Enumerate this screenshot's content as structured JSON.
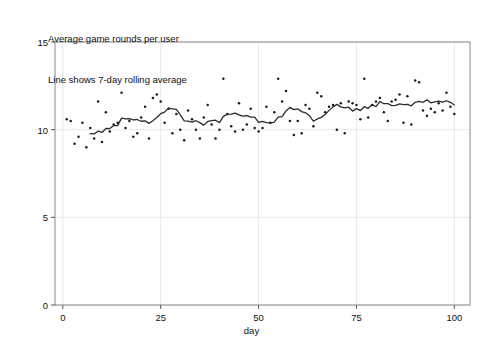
{
  "caption": {
    "line1": "Average game rounds per user",
    "line2": "Line shows 7-day rolling average"
  },
  "chart_data": {
    "type": "scatter",
    "title": "Average game rounds per user",
    "subtitle": "Line shows 7-day rolling average",
    "xlabel": "day",
    "ylabel": "",
    "xlim": [
      -2,
      104
    ],
    "ylim": [
      0,
      15
    ],
    "xticks": [
      0,
      25,
      50,
      75,
      100
    ],
    "yticks": [
      0,
      5,
      10,
      15
    ],
    "grid": true,
    "grid_color": "#e8e8e8",
    "marker_color": "#1a1a1a",
    "line_color": "#2b2b2b",
    "legend": null,
    "series": [
      {
        "name": "daily average rounds",
        "type": "scatter",
        "x": [
          1,
          2,
          3,
          4,
          5,
          6,
          7,
          8,
          9,
          10,
          11,
          12,
          13,
          14,
          15,
          16,
          17,
          18,
          19,
          20,
          21,
          22,
          23,
          24,
          25,
          26,
          27,
          28,
          29,
          30,
          31,
          32,
          33,
          34,
          35,
          36,
          37,
          38,
          39,
          40,
          41,
          42,
          43,
          44,
          45,
          46,
          47,
          48,
          49,
          50,
          51,
          52,
          53,
          54,
          55,
          56,
          57,
          58,
          59,
          60,
          61,
          62,
          63,
          64,
          65,
          66,
          67,
          68,
          69,
          70,
          71,
          72,
          73,
          74,
          75,
          76,
          77,
          78,
          79,
          80,
          81,
          82,
          83,
          84,
          85,
          86,
          87,
          88,
          89,
          90,
          91,
          92,
          93,
          94,
          95,
          96,
          97,
          98,
          99,
          100
        ],
        "y": [
          10.6,
          10.5,
          9.2,
          9.6,
          10.4,
          9.0,
          10.1,
          9.5,
          11.6,
          9.3,
          11.0,
          9.9,
          10.3,
          10.4,
          12.1,
          10.1,
          10.5,
          9.6,
          9.8,
          10.7,
          11.3,
          9.5,
          11.8,
          12.0,
          11.6,
          10.4,
          11.2,
          9.8,
          10.9,
          10.0,
          9.4,
          11.1,
          10.6,
          10.0,
          9.5,
          10.7,
          11.4,
          10.3,
          9.5,
          10.0,
          12.9,
          10.9,
          10.2,
          9.9,
          11.5,
          10.0,
          10.3,
          11.2,
          10.1,
          9.9,
          10.1,
          11.3,
          10.4,
          11.0,
          12.9,
          11.6,
          12.2,
          10.5,
          9.7,
          10.5,
          9.8,
          11.4,
          11.2,
          10.2,
          12.1,
          11.9,
          11.0,
          11.3,
          11.4,
          10.0,
          11.5,
          9.8,
          11.6,
          11.5,
          11.4,
          10.6,
          12.9,
          10.7,
          11.4,
          11.6,
          11.8,
          11.0,
          10.5,
          11.6,
          11.7,
          12.0,
          10.4,
          11.9,
          10.3,
          12.8,
          12.7,
          11.1,
          10.8,
          11.2,
          11.0,
          11.5,
          11.1,
          12.1,
          11.3,
          10.9
        ]
      },
      {
        "name": "7-day rolling average",
        "type": "line",
        "x": [
          7,
          8,
          9,
          10,
          11,
          12,
          13,
          14,
          15,
          16,
          17,
          18,
          19,
          20,
          21,
          22,
          23,
          24,
          25,
          26,
          27,
          28,
          29,
          30,
          31,
          32,
          33,
          34,
          35,
          36,
          37,
          38,
          39,
          40,
          41,
          42,
          43,
          44,
          45,
          46,
          47,
          48,
          49,
          50,
          51,
          52,
          53,
          54,
          55,
          56,
          57,
          58,
          59,
          60,
          61,
          62,
          63,
          64,
          65,
          66,
          67,
          68,
          69,
          70,
          71,
          72,
          73,
          74,
          75,
          76,
          77,
          78,
          79,
          80,
          81,
          82,
          83,
          84,
          85,
          86,
          87,
          88,
          89,
          90,
          91,
          92,
          93,
          94,
          95,
          96,
          97,
          98,
          99,
          100
        ],
        "y": [
          9.77,
          9.76,
          9.91,
          9.84,
          10.07,
          10.06,
          10.24,
          10.23,
          10.66,
          10.61,
          10.63,
          10.56,
          10.58,
          10.48,
          10.5,
          10.36,
          10.51,
          10.69,
          10.91,
          11.0,
          11.23,
          11.19,
          11.16,
          10.84,
          10.5,
          10.49,
          10.43,
          10.51,
          10.4,
          10.26,
          10.47,
          10.51,
          10.54,
          10.4,
          10.76,
          10.87,
          10.89,
          10.94,
          10.84,
          10.77,
          10.8,
          10.71,
          10.71,
          10.41,
          10.47,
          10.4,
          10.37,
          10.43,
          10.71,
          10.74,
          11.07,
          11.27,
          11.14,
          11.19,
          11.03,
          10.96,
          10.79,
          10.49,
          10.61,
          10.7,
          10.86,
          11.1,
          11.3,
          11.44,
          11.3,
          11.24,
          11.28,
          11.06,
          11.2,
          11.09,
          11.31,
          11.22,
          11.43,
          11.31,
          11.61,
          11.48,
          11.49,
          11.37,
          11.39,
          11.47,
          11.43,
          11.44,
          11.36,
          11.56,
          11.61,
          11.56,
          11.7,
          11.53,
          11.59,
          11.63,
          11.57,
          11.65,
          11.56,
          11.41
        ]
      }
    ]
  },
  "axis": {
    "x_tick_labels": [
      "0",
      "25",
      "50",
      "75",
      "100"
    ],
    "y_tick_labels": [
      "0",
      "5",
      "10",
      "15"
    ],
    "x_title": "day"
  }
}
